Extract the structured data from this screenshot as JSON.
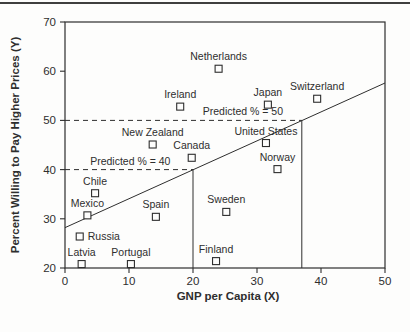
{
  "chart_data": {
    "type": "scatter",
    "title": "",
    "xlabel": "GNP per Capita (X)",
    "ylabel": "Percent Willing to Pay Higher Prices (Y)",
    "xlim": [
      0,
      50
    ],
    "ylim": [
      20,
      70
    ],
    "x_ticks": [
      0,
      10,
      20,
      30,
      40,
      50
    ],
    "y_ticks": [
      20,
      30,
      40,
      50,
      60,
      70
    ],
    "grid": false,
    "marker": "open-square",
    "legend_position": "none",
    "points": [
      {
        "label": "Netherlands",
        "x": 24.0,
        "y": 60.5,
        "label_pos": "above"
      },
      {
        "label": "Ireland",
        "x": 18.0,
        "y": 52.8,
        "label_pos": "above"
      },
      {
        "label": "Japan",
        "x": 31.7,
        "y": 53.2,
        "label_pos": "above"
      },
      {
        "label": "Switzerland",
        "x": 39.4,
        "y": 54.4,
        "label_pos": "above"
      },
      {
        "label": "New Zealand",
        "x": 13.7,
        "y": 45.1,
        "label_pos": "above"
      },
      {
        "label": "Canada",
        "x": 19.8,
        "y": 42.4,
        "label_pos": "above"
      },
      {
        "label": "United States",
        "x": 31.4,
        "y": 45.4,
        "label_pos": "above"
      },
      {
        "label": "Norway",
        "x": 33.2,
        "y": 40.1,
        "label_pos": "above"
      },
      {
        "label": "Chile",
        "x": 4.7,
        "y": 35.2,
        "label_pos": "above"
      },
      {
        "label": "Mexico",
        "x": 3.5,
        "y": 30.7,
        "label_pos": "above"
      },
      {
        "label": "Spain",
        "x": 14.2,
        "y": 30.4,
        "label_pos": "above"
      },
      {
        "label": "Sweden",
        "x": 25.2,
        "y": 31.4,
        "label_pos": "above"
      },
      {
        "label": "Russia",
        "x": 2.3,
        "y": 26.4,
        "label_pos": "right"
      },
      {
        "label": "Finland",
        "x": 23.6,
        "y": 21.4,
        "label_pos": "above"
      },
      {
        "label": "Latvia",
        "x": 2.6,
        "y": 20.8,
        "label_pos": "above"
      },
      {
        "label": "Portugal",
        "x": 10.3,
        "y": 20.8,
        "label_pos": "above"
      }
    ],
    "regression_line": {
      "x1": 0,
      "y1": 28.2,
      "x2": 50,
      "y2": 57.6
    },
    "reference_lines": [
      {
        "kind": "h-dashed",
        "y": 50,
        "x1": 0,
        "x2": 37,
        "label": "Predicted % = 50",
        "label_x": 27.8
      },
      {
        "kind": "h-dashed",
        "y": 40,
        "x1": 0,
        "x2": 20,
        "label": "Predicted % = 40",
        "label_x": 10.2
      },
      {
        "kind": "v-solid",
        "x": 20,
        "y1": 20,
        "y2": 40
      },
      {
        "kind": "v-solid",
        "x": 37,
        "y1": 20,
        "y2": 50
      }
    ]
  },
  "style": {
    "ink": "#2e2e2e",
    "background": "#fdfdfc",
    "marker_size": 7
  }
}
